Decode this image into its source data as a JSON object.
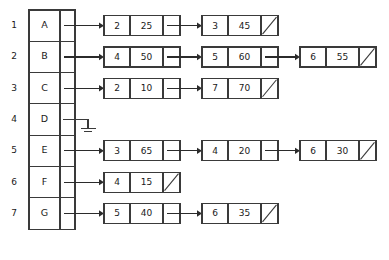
{
  "diagram": {
    "type": "adjacency-list",
    "colors": {
      "background": "#ffffff",
      "stroke": "#3a3a3a",
      "arrow": "#2b2b2b",
      "text": "#1a1a1a"
    },
    "node_fields": [
      "index",
      "value",
      "next-pointer"
    ],
    "null_marker": "diagonal-slash",
    "ground_marker": "ground-symbol",
    "table": {
      "columns": [
        "label",
        "pointer"
      ],
      "rows": [
        {
          "number": "1",
          "label": "A",
          "has_chain": true,
          "terminator": "arrow"
        },
        {
          "number": "2",
          "label": "B",
          "has_chain": true,
          "terminator": "arrow"
        },
        {
          "number": "3",
          "label": "C",
          "has_chain": true,
          "terminator": "arrow"
        },
        {
          "number": "4",
          "label": "D",
          "has_chain": false,
          "terminator": "ground"
        },
        {
          "number": "5",
          "label": "E",
          "has_chain": true,
          "terminator": "arrow"
        },
        {
          "number": "6",
          "label": "F",
          "has_chain": true,
          "terminator": "arrow"
        },
        {
          "number": "7",
          "label": "G",
          "has_chain": true,
          "terminator": "arrow"
        }
      ]
    },
    "chains": [
      {
        "row": "1",
        "label": "A",
        "nodes": [
          {
            "index": "2",
            "value": "25",
            "next": "linked"
          },
          {
            "index": "3",
            "value": "45",
            "next": "null"
          }
        ]
      },
      {
        "row": "2",
        "label": "B",
        "nodes": [
          {
            "index": "4",
            "value": "50",
            "next": "linked"
          },
          {
            "index": "5",
            "value": "60",
            "next": "linked"
          },
          {
            "index": "6",
            "value": "55",
            "next": "null"
          }
        ]
      },
      {
        "row": "3",
        "label": "C",
        "nodes": [
          {
            "index": "2",
            "value": "10",
            "next": "linked"
          },
          {
            "index": "7",
            "value": "70",
            "next": "null"
          }
        ]
      },
      {
        "row": "4",
        "label": "D",
        "nodes": []
      },
      {
        "row": "5",
        "label": "E",
        "nodes": [
          {
            "index": "3",
            "value": "65",
            "next": "linked"
          },
          {
            "index": "4",
            "value": "20",
            "next": "linked"
          },
          {
            "index": "6",
            "value": "30",
            "next": "null"
          }
        ]
      },
      {
        "row": "6",
        "label": "F",
        "nodes": [
          {
            "index": "4",
            "value": "15",
            "next": "null"
          }
        ]
      },
      {
        "row": "7",
        "label": "G",
        "nodes": [
          {
            "index": "5",
            "value": "40",
            "next": "linked"
          },
          {
            "index": "6",
            "value": "35",
            "next": "null"
          }
        ]
      }
    ]
  }
}
